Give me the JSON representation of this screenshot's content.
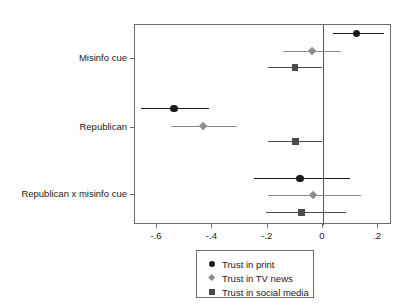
{
  "chart_data": {
    "type": "scatter",
    "subtype": "coefficient-plot-with-error-bars",
    "title": "",
    "xlabel": "",
    "ylabel": "",
    "xlim": [
      -0.68,
      0.25
    ],
    "xticks": [
      -0.6,
      -0.4,
      -0.2,
      0,
      0.2
    ],
    "xtick_labels": [
      "-.6",
      "-.4",
      "-.2",
      "0",
      ".2"
    ],
    "categories": [
      "Misinfo cue",
      "Republican",
      "Republican x misinfo cue"
    ],
    "grid": false,
    "reference_line": 0,
    "legend_position": "bottom-center",
    "series": [
      {
        "name": "Trust in print",
        "marker": "circle",
        "color": "#1a1a1a",
        "values": [
          0.125,
          -0.535,
          -0.08
        ],
        "ci_low": [
          0.04,
          -0.655,
          -0.247
        ],
        "ci_high": [
          0.225,
          -0.408,
          0.102
        ]
      },
      {
        "name": "Trust in TV news",
        "marker": "diamond",
        "color": "#8c8c8c",
        "values": [
          -0.036,
          -0.429,
          -0.033
        ],
        "ci_low": [
          -0.142,
          -0.545,
          -0.196
        ],
        "ci_high": [
          0.069,
          -0.309,
          0.142
        ]
      },
      {
        "name": "Trust in social media",
        "marker": "square",
        "color": "#4a4a4a",
        "values": [
          -0.098,
          -0.095,
          -0.073
        ],
        "ci_low": [
          -0.196,
          -0.196,
          -0.204
        ],
        "ci_high": [
          0.0,
          0.0,
          0.087
        ]
      }
    ]
  },
  "legend": {
    "items": [
      {
        "label": "Trust in print",
        "marker": "circle",
        "color": "#1a1a1a"
      },
      {
        "label": "Trust in TV news",
        "marker": "diamond",
        "color": "#8c8c8c"
      },
      {
        "label": "Trust in social media",
        "marker": "square",
        "color": "#4a4a4a"
      }
    ]
  },
  "axis": {
    "frame_color": "#6e6e6e",
    "reference_line_color": "#555555"
  }
}
